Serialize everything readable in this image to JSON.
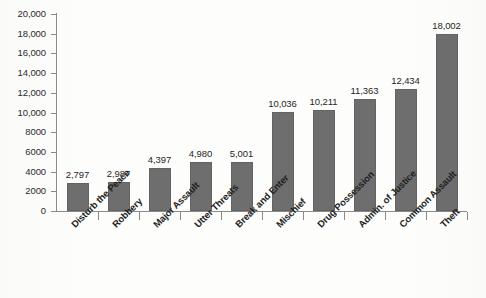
{
  "chart_data": {
    "type": "bar",
    "title": "",
    "subtitle": "",
    "xlabel": "",
    "ylabel": "",
    "ylim": [
      0,
      20000
    ],
    "grid": false,
    "legend": "none",
    "orientation": "vertical",
    "bar_color": "#6e6e6e",
    "bar_border_color": "#636363",
    "axis_color": "#8a8a8a",
    "background_color": "#fdfdfc",
    "y_ticks": [
      {
        "value": 20000,
        "label": "20,000"
      },
      {
        "value": 18000,
        "label": "18,000"
      },
      {
        "value": 16000,
        "label": "16,000"
      },
      {
        "value": 14000,
        "label": "14,000"
      },
      {
        "value": 12000,
        "label": "12,000"
      },
      {
        "value": 10000,
        "label": "10,000"
      },
      {
        "value": 8000,
        "label": "8000"
      },
      {
        "value": 6000,
        "label": "6000"
      },
      {
        "value": 4000,
        "label": "4000"
      },
      {
        "value": 2000,
        "label": "2000"
      },
      {
        "value": 0,
        "label": "0"
      }
    ],
    "categories": [
      "Disturb the Peace",
      "Robbery",
      "Major Assault",
      "Utter Threats",
      "Break and Enter",
      "Mischief",
      "Drug Possession",
      "Admin. of Justice",
      "Common Assault",
      "Theft"
    ],
    "values": [
      2797,
      2987,
      4397,
      4980,
      5001,
      10036,
      10211,
      11363,
      12434,
      18002
    ],
    "data_labels": [
      "2,797",
      "2,987",
      "4,397",
      "4,980",
      "5,001",
      "10,036",
      "10,211",
      "11,363",
      "12,434",
      "18,002"
    ]
  }
}
